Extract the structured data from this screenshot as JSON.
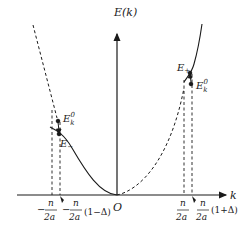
{
  "diagram": {
    "y_axis_label": "E(k)",
    "x_axis_label": "k",
    "origin_label": "O",
    "colors": {
      "stroke": "#1a1a1a",
      "background": "#ffffff"
    },
    "left": {
      "e0_label": "E",
      "e0_sub": "k",
      "e0_sup": "0",
      "e_label": "E",
      "e_sub": "−",
      "tick1": {
        "sign": "−",
        "num": "n",
        "den": "2a",
        "suffix": ""
      },
      "tick2": {
        "sign": "−",
        "num": "n",
        "den": "2a",
        "suffix": "(1−Δ)"
      }
    },
    "right": {
      "e_label": "E",
      "e_sub": "+",
      "e0_label": "E",
      "e0_sub": "k",
      "e0_sup": "0",
      "tick1": {
        "sign": "",
        "num": "n",
        "den": "2a",
        "suffix": ""
      },
      "tick2": {
        "sign": "",
        "num": "n",
        "den": "2a",
        "suffix": "(1+Δ)"
      }
    }
  }
}
